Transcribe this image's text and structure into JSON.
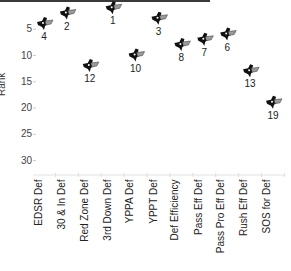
{
  "chart_data": {
    "type": "scatter",
    "title": "",
    "xlabel": "",
    "ylabel": "Rank",
    "ylim": [
      0,
      35
    ],
    "y_inverted": true,
    "y_ticks": [
      5,
      10,
      15,
      20,
      25,
      30
    ],
    "grid": false,
    "legend": null,
    "marker": "team-logo",
    "categories": [
      "EDSR Def",
      "30 & In Def",
      "Red Zone Def",
      "3rd Down Def",
      "YPPA Def",
      "YPPT Def",
      "Def Efficiency",
      "Pass Eff Def",
      "Pass Pro Eff Def",
      "Rush Eff Def",
      "SOS for Def"
    ],
    "values": [
      4,
      2,
      12,
      1,
      10,
      3,
      8,
      7,
      6,
      13,
      19
    ],
    "data_labels": [
      "4",
      "2",
      "12",
      "1",
      "10",
      "3",
      "8",
      "7",
      "6",
      "13",
      "19"
    ]
  },
  "axis": {
    "ylabel": "Rank",
    "ytick_labels": [
      "5",
      "10",
      "15",
      "20",
      "25",
      "30"
    ]
  },
  "colors": {
    "marker_dark": "#111111",
    "marker_light": "#9a9a9a",
    "axis_text": "#444444",
    "top_border": "#3a3a3a"
  }
}
